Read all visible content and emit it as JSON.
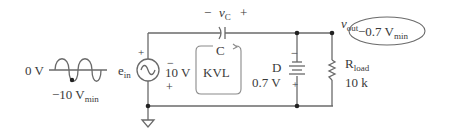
{
  "diagram": {
    "type": "circuit-schematic",
    "waveform": {
      "zero_label": "0 V",
      "min_label_main": "−10 V",
      "min_label_sub": "min"
    },
    "source": {
      "name_main": "e",
      "name_sub": "in",
      "plus_sign": "+"
    },
    "capacitor": {
      "voltage_label_main": "v",
      "voltage_label_sub": "C",
      "minus_sign": "−",
      "plus_sign": "+",
      "name": "C",
      "drop_minus": "−",
      "drop_value": "10 V",
      "drop_plus": "+"
    },
    "loop": {
      "label": "KVL"
    },
    "diode": {
      "name": "D",
      "value": "0.7 V",
      "minus_sign": "−",
      "plus_sign": "+"
    },
    "output": {
      "label_main": "v",
      "label_sub": "out"
    },
    "load": {
      "name_main": "R",
      "name_sub": "load",
      "value": "10 k"
    },
    "result": {
      "value_main": "−0.7 V",
      "value_sub": "min"
    },
    "colors": {
      "wire": "#6a6a6a",
      "text": "#3a3a3a",
      "node": "#222222"
    }
  }
}
